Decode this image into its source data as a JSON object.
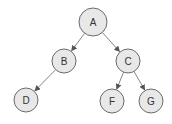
{
  "diagram": {
    "type": "binary-tree",
    "nodes": [
      {
        "id": "A",
        "label": "A",
        "x": 93,
        "y": 22,
        "r": 14
      },
      {
        "id": "B",
        "label": "B",
        "x": 64,
        "y": 61,
        "r": 12
      },
      {
        "id": "C",
        "label": "C",
        "x": 128,
        "y": 61,
        "r": 12
      },
      {
        "id": "D",
        "label": "D",
        "x": 26,
        "y": 100,
        "r": 12
      },
      {
        "id": "F",
        "label": "F",
        "x": 112,
        "y": 101,
        "r": 12
      },
      {
        "id": "G",
        "label": "G",
        "x": 151,
        "y": 101,
        "r": 12
      }
    ],
    "edges": [
      {
        "from": "A",
        "to": "B"
      },
      {
        "from": "A",
        "to": "C"
      },
      {
        "from": "B",
        "to": "D"
      },
      {
        "from": "C",
        "to": "F"
      },
      {
        "from": "C",
        "to": "G"
      }
    ],
    "colors": {
      "node_fill": "#e8e8e8",
      "node_stroke": "#6a6a6a",
      "edge": "#777777"
    }
  }
}
